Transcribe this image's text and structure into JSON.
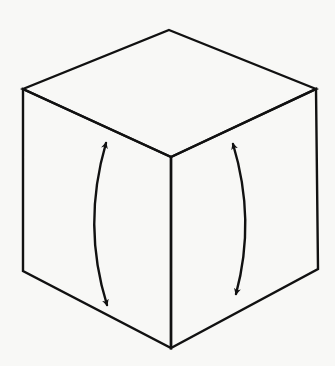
{
  "diagram": {
    "colors": {
      "background": "#f8f8f6",
      "stroke": "#111111"
    },
    "cube": {
      "vertices": {
        "top": [
          169,
          30
        ],
        "left_top": [
          23,
          89
        ],
        "right_top": [
          316,
          89
        ],
        "front_top": [
          171,
          157
        ],
        "left_bottom": [
          23,
          271
        ],
        "right_bottom": [
          318,
          269
        ],
        "front_bottom": [
          171,
          348
        ]
      },
      "faces": [
        "top",
        "left",
        "right"
      ]
    },
    "arrows": [
      {
        "id": "left-face-arrow",
        "face": "left",
        "direction": "bidirectional-vertical",
        "start": [
          106,
          143
        ],
        "control": [
          82,
          225
        ],
        "end": [
          107,
          305
        ]
      },
      {
        "id": "right-face-arrow",
        "face": "right",
        "direction": "bidirectional-vertical",
        "start": [
          233,
          144
        ],
        "control": [
          256,
          220
        ],
        "end": [
          236,
          294
        ]
      }
    ]
  }
}
